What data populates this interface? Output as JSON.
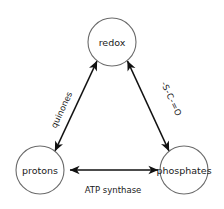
{
  "diagram": {
    "type": "cycle-triangle",
    "background_color": "#ffffff",
    "node_stroke_color": "#6b6b6b",
    "edge_color": "#111111",
    "text_color": "#1a1a1a",
    "nodes": [
      {
        "id": "redox",
        "label": "redox",
        "cx": 112,
        "cy": 42,
        "r": 24
      },
      {
        "id": "protons",
        "label": "protons",
        "cx": 40,
        "cy": 170,
        "r": 24
      },
      {
        "id": "phosphates",
        "label": "phosphates",
        "cx": 184,
        "cy": 170,
        "r": 24
      }
    ],
    "edges": [
      {
        "id": "protons-redox",
        "from": "protons",
        "to": "redox",
        "label": "quinones",
        "arrowheads": "both"
      },
      {
        "id": "redox-phosphates",
        "from": "redox",
        "to": "phosphates",
        "label": "-S-C-=O",
        "arrowheads": "both"
      },
      {
        "id": "protons-phosphates",
        "from": "protons",
        "to": "phosphates",
        "label": "ATP synthase",
        "arrowheads": "both"
      }
    ]
  }
}
